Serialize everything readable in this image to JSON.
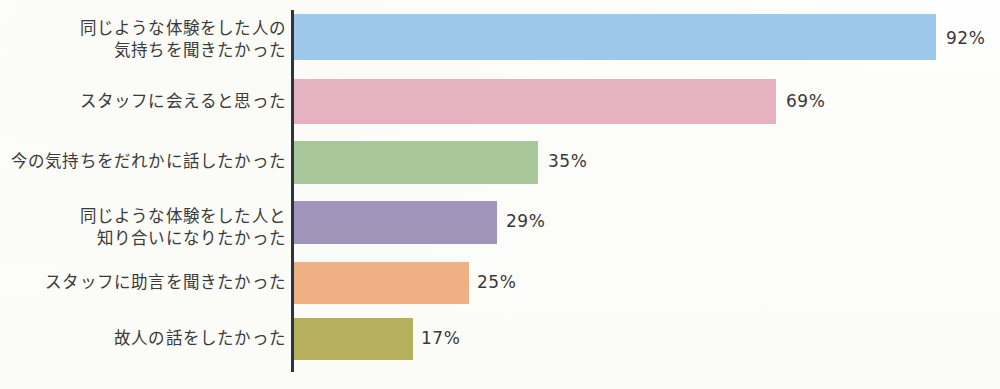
{
  "chart_data": {
    "type": "bar",
    "orientation": "horizontal",
    "title": "",
    "subtitle": "",
    "xlabel": "",
    "ylabel": "",
    "xlim": [
      0,
      100
    ],
    "grid": false,
    "legend": false,
    "value_suffix": "%",
    "categories": [
      "同じような体験をした人の\n気持ちを聞きたかった",
      "スタッフに会えると思った",
      "今の気持ちをだれかに話したかった",
      "同じような体験をした人と\n知り合いになりたかった",
      "スタッフに助言を聞きたかった",
      "故人の話をしたかった"
    ],
    "values": [
      92,
      69,
      35,
      29,
      25,
      17
    ],
    "value_labels": [
      "92%",
      "69%",
      "35%",
      "29%",
      "25%",
      "17%"
    ],
    "colors": [
      "#9dc8ec",
      "#e7b2bf",
      "#a8c89a",
      "#a095b8",
      "#efb183",
      "#b5b05e"
    ],
    "axis_color": "#2e3340"
  },
  "bars": [
    {
      "label": "同じような体験をした人の\n気持ちを聞きたかった",
      "value": 92,
      "value_label": "92%",
      "color": "#9dc8ec",
      "top": 14,
      "height": 46,
      "width": 642,
      "label_top": 18,
      "value_left": 946,
      "value_top": 30
    },
    {
      "label": "スタッフに会えると思った",
      "value": 69,
      "value_label": "69%",
      "color": "#e7b2bf",
      "top": 79,
      "height": 45,
      "width": 482,
      "label_top": 91,
      "value_left": 786,
      "value_top": 93
    },
    {
      "label": "今の気持ちをだれかに話したかった",
      "value": 35,
      "value_label": "35%",
      "color": "#a8c89a",
      "top": 141,
      "height": 43,
      "width": 244,
      "label_top": 151,
      "value_left": 548,
      "value_top": 153
    },
    {
      "label": "同じような体験をした人と\n知り合いになりたかった",
      "value": 29,
      "value_label": "29%",
      "color": "#a095b8",
      "top": 201,
      "height": 43,
      "width": 203,
      "label_top": 206,
      "value_left": 506,
      "value_top": 213
    },
    {
      "label": "スタッフに助言を聞きたかった",
      "value": 25,
      "value_label": "25%",
      "color": "#efb183",
      "top": 262,
      "height": 42,
      "width": 175,
      "label_top": 272,
      "value_left": 477,
      "value_top": 274
    },
    {
      "label": "故人の話をしたかった",
      "value": 17,
      "value_label": "17%",
      "color": "#b5b05e",
      "top": 318,
      "height": 42,
      "width": 119,
      "label_top": 328,
      "value_left": 421,
      "value_top": 330
    }
  ]
}
